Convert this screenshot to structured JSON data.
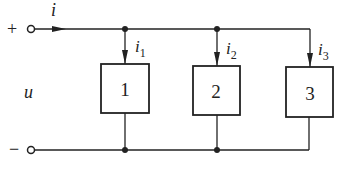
{
  "diagram": {
    "type": "parallel-circuit",
    "terminals": {
      "plus": "+",
      "minus": "−"
    },
    "voltage_label": "u",
    "total_current": "i",
    "branches": [
      {
        "box_label": "1",
        "current": "i",
        "sub": "1"
      },
      {
        "box_label": "2",
        "current": "i",
        "sub": "2"
      },
      {
        "box_label": "3",
        "current": "i",
        "sub": "3"
      }
    ]
  },
  "colors": {
    "line": "#222222",
    "background": "#ffffff"
  }
}
